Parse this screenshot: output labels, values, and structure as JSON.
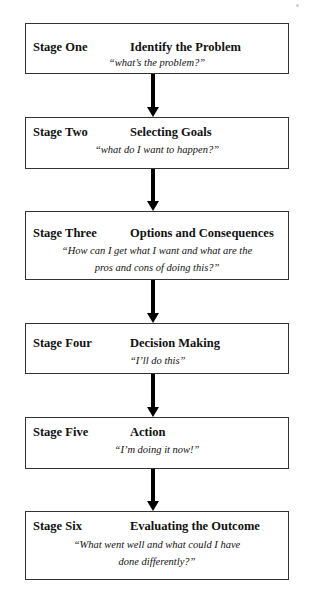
{
  "diagram": {
    "type": "flowchart",
    "direction": "top-to-bottom",
    "stages": [
      {
        "number": "Stage One",
        "title": "Identify the Problem",
        "quote_lines": [
          "“what’s the problem?”"
        ]
      },
      {
        "number": "Stage Two",
        "title": "Selecting Goals",
        "quote_lines": [
          "“what do I want to happen?”"
        ]
      },
      {
        "number": "Stage Three",
        "title": "Options and Consequences",
        "quote_lines": [
          "“How can I get what I want and what are the",
          "pros and cons of doing this?”"
        ]
      },
      {
        "number": "Stage Four",
        "title": "Decision Making",
        "quote_lines": [
          "“I’ll do this”"
        ]
      },
      {
        "number": "Stage Five",
        "title": "Action",
        "quote_lines": [
          "“I’m doing it now!”"
        ]
      },
      {
        "number": "Stage Six",
        "title": "Evaluating the Outcome",
        "quote_lines": [
          "“What went well and what could I have",
          "done differently?”"
        ]
      }
    ],
    "arrows": [
      {
        "from": "Stage One",
        "to": "Stage Two"
      },
      {
        "from": "Stage Two",
        "to": "Stage Three"
      },
      {
        "from": "Stage Three",
        "to": "Stage Four"
      },
      {
        "from": "Stage Four",
        "to": "Stage Five"
      },
      {
        "from": "Stage Five",
        "to": "Stage Six"
      }
    ],
    "colors": {
      "box_border": "#333333",
      "arrow": "#000000",
      "text": "#111111",
      "background": "#ffffff"
    }
  }
}
